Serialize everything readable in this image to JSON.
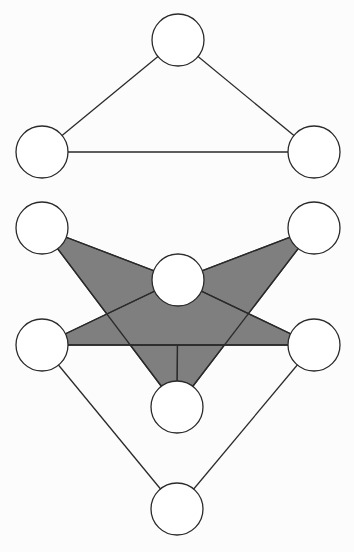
{
  "diagram": {
    "background": "#fcfcfc",
    "stroke_color": "#2a2a2a",
    "node_fill": "#ffffff",
    "shade_fill": "#7f7f7f",
    "node_radius": 26,
    "graphs": [
      {
        "name": "triangle-graph",
        "nodes": [
          {
            "id": "t-top",
            "x": 178,
            "y": 40
          },
          {
            "id": "t-left",
            "x": 42,
            "y": 152
          },
          {
            "id": "t-right",
            "x": 314,
            "y": 152
          }
        ],
        "edges": [
          [
            "t-top",
            "t-left"
          ],
          [
            "t-top",
            "t-right"
          ],
          [
            "t-left",
            "t-right"
          ]
        ],
        "shaded_faces": []
      },
      {
        "name": "shaded-complex",
        "nodes": [
          {
            "id": "upper-left",
            "x": 42,
            "y": 228
          },
          {
            "id": "upper-right",
            "x": 314,
            "y": 228
          },
          {
            "id": "center",
            "x": 178,
            "y": 280
          },
          {
            "id": "mid-left",
            "x": 42,
            "y": 345
          },
          {
            "id": "mid-right",
            "x": 314,
            "y": 345
          },
          {
            "id": "lower-center",
            "x": 177,
            "y": 407
          },
          {
            "id": "bottom",
            "x": 177,
            "y": 509
          }
        ],
        "edges": [
          [
            "upper-left",
            "center"
          ],
          [
            "upper-left",
            "lower-center"
          ],
          [
            "upper-right",
            "center"
          ],
          [
            "upper-right",
            "lower-center"
          ],
          [
            "mid-left",
            "center"
          ],
          [
            "mid-right",
            "center"
          ],
          [
            "mid-left",
            "mid-right"
          ],
          [
            "mid-left",
            "bottom"
          ],
          [
            "mid-right",
            "bottom"
          ]
        ],
        "shaded_faces": [
          [
            "upper-left",
            "center",
            "lower-center"
          ],
          [
            "upper-right",
            "center",
            "lower-center"
          ],
          [
            "mid-left",
            "center",
            "mid-right"
          ]
        ]
      }
    ]
  }
}
